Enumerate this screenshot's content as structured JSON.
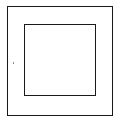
{
  "diagram": {
    "shapes": [
      {
        "name": "outer-square",
        "x": 7,
        "y": 6,
        "w": 106,
        "h": 110,
        "stroke": "#1a1a1a",
        "stroke_width": 1
      },
      {
        "name": "inner-square",
        "x": 24,
        "y": 24,
        "w": 72,
        "h": 72,
        "stroke": "#1a1a1a",
        "stroke_width": 1
      }
    ],
    "marks": [
      {
        "name": "speck",
        "x": 13,
        "y": 62,
        "color": "#888888"
      }
    ]
  }
}
